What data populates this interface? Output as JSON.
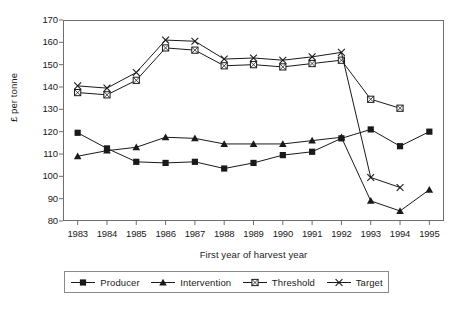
{
  "chart_data": {
    "type": "line",
    "title": "",
    "xlabel": "First year of harvest year",
    "ylabel": "£ per tonne",
    "categories": [
      "1983",
      "1984",
      "1985",
      "1986",
      "1987",
      "1988",
      "1989",
      "1990",
      "1991",
      "1992",
      "1993",
      "1994",
      "1995"
    ],
    "x": [
      1983,
      1984,
      1985,
      1986,
      1987,
      1988,
      1989,
      1990,
      1991,
      1992,
      1993,
      1994,
      1995
    ],
    "ylim": [
      80,
      170
    ],
    "yticks": [
      80,
      90,
      100,
      110,
      120,
      130,
      140,
      150,
      160,
      170
    ],
    "grid": false,
    "legend_position": "bottom",
    "series": [
      {
        "name": "Producer",
        "marker": "filled-square",
        "values": [
          119.5,
          112.5,
          106.5,
          106.0,
          106.5,
          103.5,
          106.0,
          109.5,
          111.0,
          117.0,
          121.0,
          113.5,
          120.0
        ]
      },
      {
        "name": "Intervention",
        "marker": "filled-triangle",
        "values": [
          109.0,
          111.5,
          113.0,
          117.5,
          117.0,
          114.5,
          114.5,
          114.5,
          116.0,
          117.5,
          89.0,
          84.5,
          94.0
        ]
      },
      {
        "name": "Threshold",
        "marker": "crossed-square",
        "values": [
          137.5,
          136.5,
          143.0,
          157.5,
          156.5,
          149.5,
          150.0,
          149.0,
          150.5,
          152.0,
          134.5,
          130.5,
          null
        ]
      },
      {
        "name": "Target",
        "marker": "cross-x",
        "values": [
          140.5,
          139.5,
          146.5,
          161.0,
          160.5,
          152.5,
          153.0,
          152.0,
          153.5,
          155.5,
          99.5,
          95.0,
          null
        ]
      }
    ]
  },
  "legend": {
    "items": [
      {
        "label": "Producer"
      },
      {
        "label": "Intervention"
      },
      {
        "label": "Threshold"
      },
      {
        "label": "Target"
      }
    ]
  },
  "caption": {
    "text": ""
  },
  "colors": {
    "line": "#1a1a1a",
    "axis": "#6e6e6e",
    "background": "#ffffff"
  }
}
